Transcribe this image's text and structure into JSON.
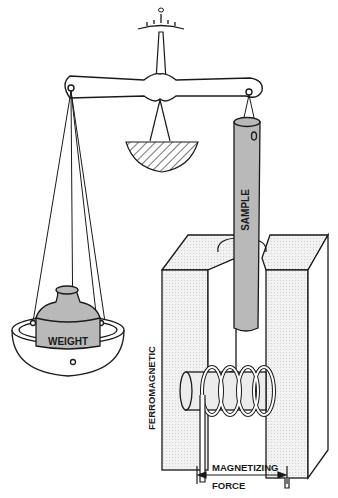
{
  "diagram": {
    "labels": {
      "weight": "WEIGHT",
      "sample": "SAMPLE",
      "ferromagnetic": "FERROMAGNETIC",
      "magnetizing": "MAGNETIZING",
      "force": "FORCE"
    },
    "colors": {
      "ink": "#1a1a1a",
      "gray_fill": "#b9b9b9",
      "light_fill": "#ececec",
      "paper": "#ffffff"
    }
  }
}
